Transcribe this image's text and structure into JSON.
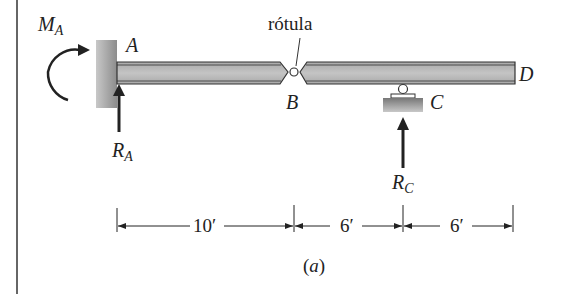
{
  "figure": {
    "caption_open": "(",
    "caption_letter": "a",
    "caption_close": ")"
  },
  "labels": {
    "moment_main": "M",
    "moment_sub": "A",
    "point_a": "A",
    "point_b": "B",
    "point_c": "C",
    "point_d": "D",
    "reaction_a_main": "R",
    "reaction_a_sub": "A",
    "reaction_c_main": "R",
    "reaction_c_sub": "C",
    "hinge_callout": "rótula"
  },
  "dimensions": [
    {
      "label": "10′",
      "from": "A",
      "to": "B"
    },
    {
      "label": "6′",
      "from": "B",
      "to": "C"
    },
    {
      "label": "6′",
      "from": "C",
      "to": "D"
    }
  ],
  "colors": {
    "beam_fill": "#bdbdbd",
    "beam_edge": "#333333",
    "support": "#9a9a9a",
    "ink": "#222222"
  }
}
